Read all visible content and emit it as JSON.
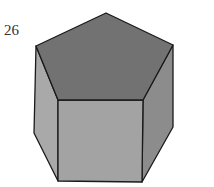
{
  "figure": {
    "number_label": "26",
    "shape": "pentagonal prism",
    "colors": {
      "top": "#727272",
      "left": "#a9a9a9",
      "front": "#a3a3a3",
      "right": "#8c8c8c",
      "edge": "#1a1a1a"
    }
  }
}
